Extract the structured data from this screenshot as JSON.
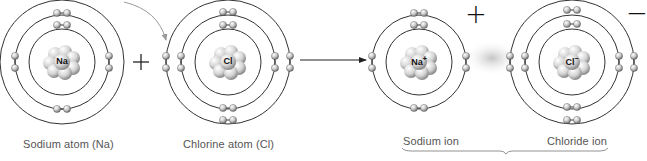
{
  "diagram": {
    "reactants": [
      {
        "id": "na",
        "symbol": "Na",
        "label": "Sodium atom (Na)",
        "cx": 62,
        "cy": 62,
        "shells": [
          33,
          47,
          62
        ],
        "electrons": [
          [
            2,
            "top"
          ],
          [
            8,
            "mid"
          ],
          [
            1,
            "outer"
          ]
        ]
      },
      {
        "id": "cl",
        "symbol": "Cl",
        "label": "Chlorine atom (Cl)",
        "cx": 228,
        "cy": 62,
        "shells": [
          33,
          47,
          62
        ],
        "electrons": [
          [
            2,
            "top"
          ],
          [
            8,
            "mid"
          ],
          [
            7,
            "outer"
          ]
        ]
      }
    ],
    "products": [
      {
        "id": "na_ion",
        "symbol": "Na",
        "superscript": "+",
        "label": "Sodium ion",
        "charge": "+",
        "cx": 419,
        "cy": 62,
        "shells": [
          33,
          47
        ]
      },
      {
        "id": "cl_ion",
        "symbol": "Cl",
        "superscript": "−",
        "label": "Chloride ion",
        "charge": "−",
        "cx": 572,
        "cy": 62,
        "shells": [
          33,
          47,
          62
        ]
      }
    ],
    "plus_sign": "+",
    "na_nucleus": "Na",
    "cl_nucleus": "Cl",
    "na_ion_nucleus": "Na",
    "na_ion_sup": "+",
    "cl_ion_nucleus": "Cl",
    "cl_ion_sup": "−",
    "labels": {
      "sodium_atom": "Sodium atom (Na)",
      "chlorine_atom": "Chlorine atom (Cl)",
      "sodium_ion": "Sodium ion",
      "chloride_ion": "Chloride ion"
    },
    "charges": {
      "positive": "+",
      "negative": "−"
    },
    "colors": {
      "line": "#333333",
      "electron": "#bdbdbd",
      "nucleus": "#cfcfcf",
      "text": "#555555",
      "arrow_curve": "#999999",
      "bond_glow": "#cccccc"
    }
  }
}
